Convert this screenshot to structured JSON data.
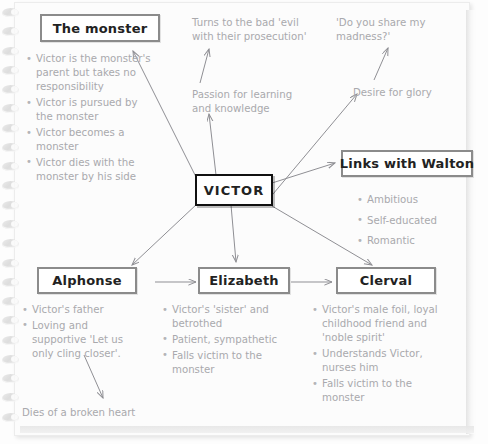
{
  "page": {
    "type": "notebook-mind-map",
    "paper_color": "#fcfcfc",
    "text_color": "#a9a9ad",
    "box_border_color": "#8b8b8b",
    "center_border_color": "#111111",
    "spiral_ring_count": 22
  },
  "center": {
    "label": "VICTOR"
  },
  "nodes": {
    "monster": {
      "title": "The monster",
      "bullets": [
        "Victor is the monster's parent but takes no responsibility",
        "Victor is pursued by the monster",
        "Victor becomes a monster",
        "Victor dies with the monster by his side"
      ]
    },
    "walton": {
      "title": "Links with Walton",
      "bullets": [
        "Ambitious",
        "Self-educated",
        "Romantic"
      ]
    },
    "alphonse": {
      "title": "Alphonse",
      "bullets": [
        "Victor's father",
        "Loving and supportive 'Let us only cling closer'."
      ],
      "outcome": "Dies of a broken heart"
    },
    "elizabeth": {
      "title": "Elizabeth",
      "bullets": [
        "Victor's 'sister' and betrothed",
        "Patient, sympathetic",
        "Falls victim to the monster"
      ]
    },
    "clerval": {
      "title": "Clerval",
      "bullets": [
        "Victor's male foil, loyal childhood friend and 'noble spirit'",
        "Understands Victor, nurses him",
        "Falls victim to the monster"
      ]
    }
  },
  "annotations": {
    "passion": "Passion for learning and knowledge",
    "turns_bad": "Turns to the bad 'evil with their prosecution'",
    "desire_glory": "Desire for glory",
    "madness": "'Do you share my madness?'"
  },
  "connections": [
    {
      "from": "VICTOR",
      "to": "The monster"
    },
    {
      "from": "VICTOR",
      "to": "Passion for learning and knowledge"
    },
    {
      "from": "Passion for learning and knowledge",
      "to": "Turns to the bad 'evil with their prosecution'"
    },
    {
      "from": "VICTOR",
      "to": "Desire for glory"
    },
    {
      "from": "Desire for glory",
      "to": "'Do you share my madness?'"
    },
    {
      "from": "VICTOR",
      "to": "Links with Walton"
    },
    {
      "from": "VICTOR",
      "to": "Alphonse"
    },
    {
      "from": "VICTOR",
      "to": "Elizabeth"
    },
    {
      "from": "VICTOR",
      "to": "Clerval"
    },
    {
      "from": "Alphonse",
      "to": "Elizabeth"
    },
    {
      "from": "Elizabeth",
      "to": "Clerval"
    },
    {
      "from": "Alphonse bullets",
      "to": "Dies of a broken heart"
    }
  ]
}
